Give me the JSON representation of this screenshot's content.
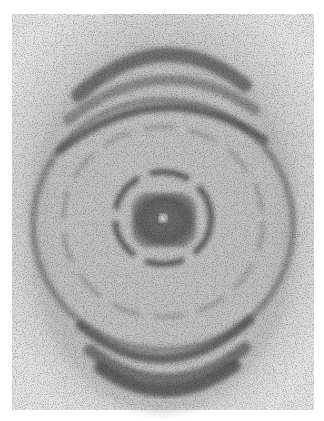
{
  "figure": {
    "kind": "x-ray fiber diffraction photograph",
    "colors": {
      "background": "#ffffff",
      "film": "#d8d8d8",
      "dark_band": "#4a4a4a",
      "core": "#555555",
      "center_spot": "#e6e6e6"
    },
    "frame": {
      "x": 12,
      "y": 14,
      "width": 302,
      "height": 396
    },
    "center": {
      "x": 163,
      "y": 218
    }
  }
}
